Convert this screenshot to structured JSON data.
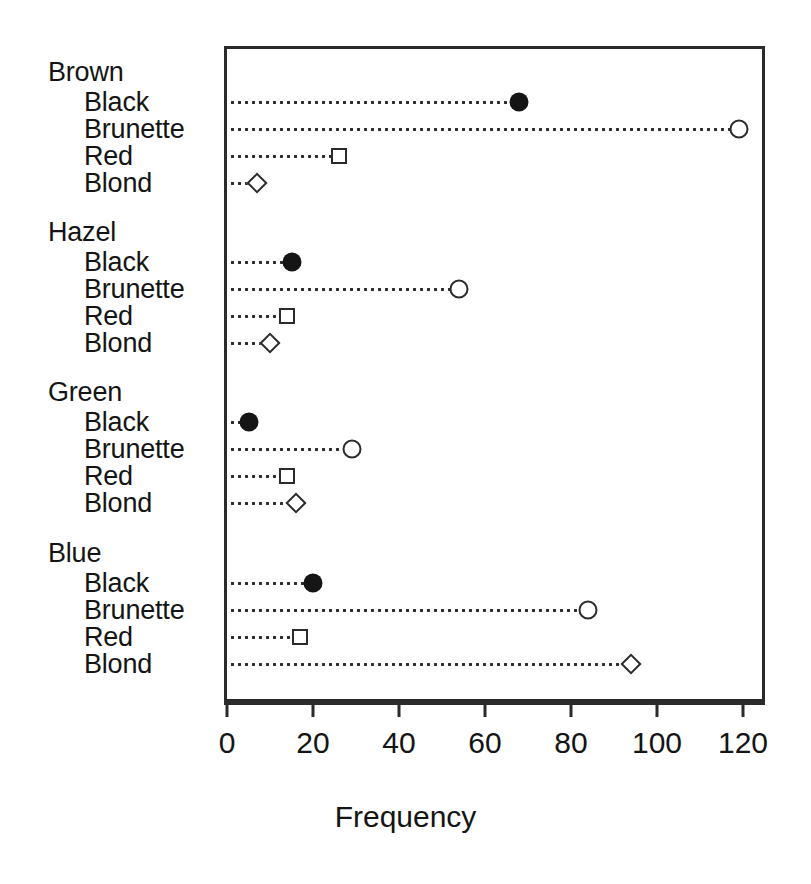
{
  "chart_data": {
    "type": "scatter",
    "subtype": "cleveland-dot-plot",
    "title": "",
    "xlabel": "Frequency",
    "ylabel": "",
    "xlim": [
      0,
      120
    ],
    "ylim": [
      0,
      1
    ],
    "grid": false,
    "legend": "none",
    "xticks": [
      0,
      20,
      40,
      60,
      80,
      100,
      120
    ],
    "xticklabels": [
      "0",
      "20",
      "40",
      "60",
      "80",
      "100",
      "120"
    ],
    "groups": [
      {
        "name": "Brown",
        "rows": [
          {
            "label": "Black",
            "value": 68,
            "marker": "filled-circle"
          },
          {
            "label": "Brunette",
            "value": 119,
            "marker": "open-circle"
          },
          {
            "label": "Red",
            "value": 26,
            "marker": "open-square"
          },
          {
            "label": "Blond",
            "value": 7,
            "marker": "open-diamond"
          }
        ]
      },
      {
        "name": "Hazel",
        "rows": [
          {
            "label": "Black",
            "value": 15,
            "marker": "filled-circle"
          },
          {
            "label": "Brunette",
            "value": 54,
            "marker": "open-circle"
          },
          {
            "label": "Red",
            "value": 14,
            "marker": "open-square"
          },
          {
            "label": "Blond",
            "value": 10,
            "marker": "open-diamond"
          }
        ]
      },
      {
        "name": "Green",
        "rows": [
          {
            "label": "Black",
            "value": 5,
            "marker": "filled-circle"
          },
          {
            "label": "Brunette",
            "value": 29,
            "marker": "open-circle"
          },
          {
            "label": "Red",
            "value": 14,
            "marker": "open-square"
          },
          {
            "label": "Blond",
            "value": 16,
            "marker": "open-diamond"
          }
        ]
      },
      {
        "name": "Blue",
        "rows": [
          {
            "label": "Black",
            "value": 20,
            "marker": "filled-circle"
          },
          {
            "label": "Brunette",
            "value": 84,
            "marker": "open-circle"
          },
          {
            "label": "Red",
            "value": 17,
            "marker": "open-square"
          },
          {
            "label": "Blond",
            "value": 94,
            "marker": "open-diamond"
          }
        ]
      }
    ]
  },
  "axis": {
    "x_title": "Frequency"
  },
  "colors": {
    "ink": "#2b2b2b",
    "marker_fill": "#151515",
    "marker_open": "#ffffff",
    "background": "#ffffff"
  },
  "geometry": {
    "plot_left": 224,
    "plot_top": 46,
    "plot_width": 541,
    "plot_height": 656,
    "x0_px": 227,
    "x_px_per_unit": 4.3,
    "row_y": [
      102,
      129,
      156,
      183,
      262,
      289,
      316,
      343,
      422,
      449,
      476,
      503,
      583,
      610,
      637,
      664
    ],
    "group_label_y": [
      72,
      232,
      392,
      553
    ]
  }
}
